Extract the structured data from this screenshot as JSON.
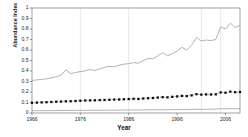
{
  "chart_data": {
    "type": "line",
    "title": "",
    "xlabel": "Year",
    "ylabel": "Abundance Index",
    "xlim": [
      1966,
      2009
    ],
    "ylim": [
      0,
      1
    ],
    "grid": "vertical-faint",
    "legend_position": "none",
    "y_ticks": [
      "0",
      "0.1",
      "0.2",
      "0.3",
      "0.4",
      "0.5",
      "0.6",
      "0.7",
      "0.8",
      "0.9",
      "1"
    ],
    "y_tick_values": [
      0,
      0.1,
      0.2,
      0.3,
      0.4,
      0.5,
      0.6,
      0.7,
      0.8,
      0.9,
      1
    ],
    "x_ticks": [
      "1966",
      "1976",
      "1986",
      "1996",
      "2006"
    ],
    "x_tick_values": [
      1966,
      1976,
      1986,
      1996,
      2006
    ],
    "gridlines_x": [
      1976,
      1986,
      2001,
      2005
    ],
    "x": [
      1966,
      1967,
      1968,
      1969,
      1970,
      1971,
      1972,
      1973,
      1974,
      1975,
      1976,
      1977,
      1978,
      1979,
      1980,
      1981,
      1982,
      1983,
      1984,
      1985,
      1986,
      1987,
      1988,
      1989,
      1990,
      1991,
      1992,
      1993,
      1994,
      1995,
      1996,
      1997,
      1998,
      1999,
      2000,
      2001,
      2002,
      2003,
      2004,
      2005,
      2006,
      2007,
      2008,
      2009
    ],
    "series": [
      {
        "name": "upper-line",
        "style": "solid-line",
        "color": "#9a9a9a",
        "values": [
          0.31,
          0.315,
          0.32,
          0.325,
          0.335,
          0.345,
          0.36,
          0.41,
          0.375,
          0.385,
          0.395,
          0.4,
          0.415,
          0.405,
          0.42,
          0.435,
          0.445,
          0.44,
          0.455,
          0.465,
          0.47,
          0.48,
          0.475,
          0.5,
          0.52,
          0.515,
          0.545,
          0.575,
          0.545,
          0.565,
          0.59,
          0.625,
          0.6,
          0.645,
          0.72,
          0.685,
          0.695,
          0.69,
          0.7,
          0.82,
          0.8,
          0.855,
          0.815,
          0.835
        ]
      },
      {
        "name": "middle-dotted-line",
        "style": "dotted-squares",
        "color": "#111111",
        "values": [
          0.097,
          0.099,
          0.101,
          0.103,
          0.105,
          0.107,
          0.109,
          0.111,
          0.112,
          0.114,
          0.117,
          0.119,
          0.12,
          0.121,
          0.123,
          0.124,
          0.126,
          0.128,
          0.129,
          0.131,
          0.133,
          0.135,
          0.134,
          0.138,
          0.141,
          0.143,
          0.147,
          0.151,
          0.149,
          0.154,
          0.158,
          0.163,
          0.161,
          0.168,
          0.179,
          0.175,
          0.177,
          0.176,
          0.178,
          0.196,
          0.193,
          0.203,
          0.198,
          0.2
        ]
      },
      {
        "name": "lower-line",
        "style": "solid-line",
        "color": "#9a9a9a",
        "values": [
          0.022,
          0.022,
          0.022,
          0.023,
          0.023,
          0.023,
          0.024,
          0.024,
          0.024,
          0.025,
          0.025,
          0.025,
          0.026,
          0.026,
          0.026,
          0.027,
          0.027,
          0.027,
          0.028,
          0.028,
          0.028,
          0.029,
          0.029,
          0.029,
          0.03,
          0.03,
          0.031,
          0.031,
          0.031,
          0.032,
          0.032,
          0.033,
          0.033,
          0.034,
          0.036,
          0.035,
          0.036,
          0.036,
          0.037,
          0.041,
          0.04,
          0.042,
          0.041,
          0.042
        ]
      }
    ]
  },
  "axes": {
    "ylabel": "Abundance Index",
    "xlabel": "Year"
  },
  "caption": {
    "text": ""
  }
}
